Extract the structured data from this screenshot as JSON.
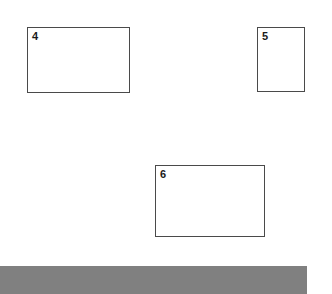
{
  "canvas": {
    "width": 332,
    "height": 294,
    "background_color": "#ffffff"
  },
  "boxes": [
    {
      "label": "4",
      "x": 27,
      "y": 27,
      "width": 103,
      "height": 66,
      "border_color": "#4a4a4a",
      "fill_color": "#ffffff"
    },
    {
      "label": "5",
      "x": 257,
      "y": 27,
      "width": 48,
      "height": 65,
      "border_color": "#4a4a4a",
      "fill_color": "#ffffff"
    },
    {
      "label": "6",
      "x": 155,
      "y": 165,
      "width": 110,
      "height": 72,
      "border_color": "#4a4a4a",
      "fill_color": "#ffffff"
    }
  ],
  "bottom_bar": {
    "x": 0,
    "y": 266,
    "width": 307,
    "height": 28,
    "color": "#808080"
  }
}
